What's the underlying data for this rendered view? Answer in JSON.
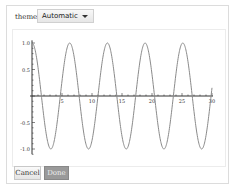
{
  "control": {
    "label": "theme",
    "dropdown_value": "Automatic",
    "dropdown_icon": "chevron-down-icon"
  },
  "buttons": {
    "cancel_label": "Cancel",
    "done_label": "Done"
  },
  "chart_data": {
    "type": "line",
    "title": "",
    "xlabel": "",
    "ylabel": "",
    "function": "cos(x)",
    "xlim": [
      0,
      30
    ],
    "ylim": [
      -1.0,
      1.0
    ],
    "x_ticks": [
      "5",
      "10",
      "15",
      "20",
      "25",
      "30"
    ],
    "y_ticks": [
      "1.0",
      "0.5",
      "-0.5",
      "-1.0"
    ],
    "grid": false,
    "line_color": "#8a8a8a",
    "series": [
      {
        "name": "cos(x)",
        "x": [
          0,
          3.14,
          6.28,
          9.42,
          12.57,
          15.71,
          18.85,
          21.99,
          25.13,
          28.27,
          30
        ],
        "values": [
          1.0,
          -1.0,
          1.0,
          -1.0,
          1.0,
          -1.0,
          1.0,
          -1.0,
          1.0,
          -1.0,
          0.15
        ]
      }
    ]
  }
}
